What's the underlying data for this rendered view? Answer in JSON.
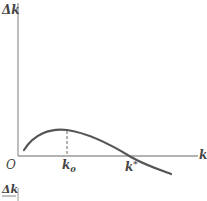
{
  "diagram": {
    "y_axis_label": "Δk",
    "x_axis_label": "k",
    "origin_label": "O",
    "k0_label": "k",
    "k0_sub": "0",
    "kstar_label": "k",
    "kstar_sup": "*",
    "bottom_fraction_label": "Δk",
    "colors": {
      "axis": "#9a9a9a",
      "curve": "#555555",
      "text": "#444444"
    }
  }
}
